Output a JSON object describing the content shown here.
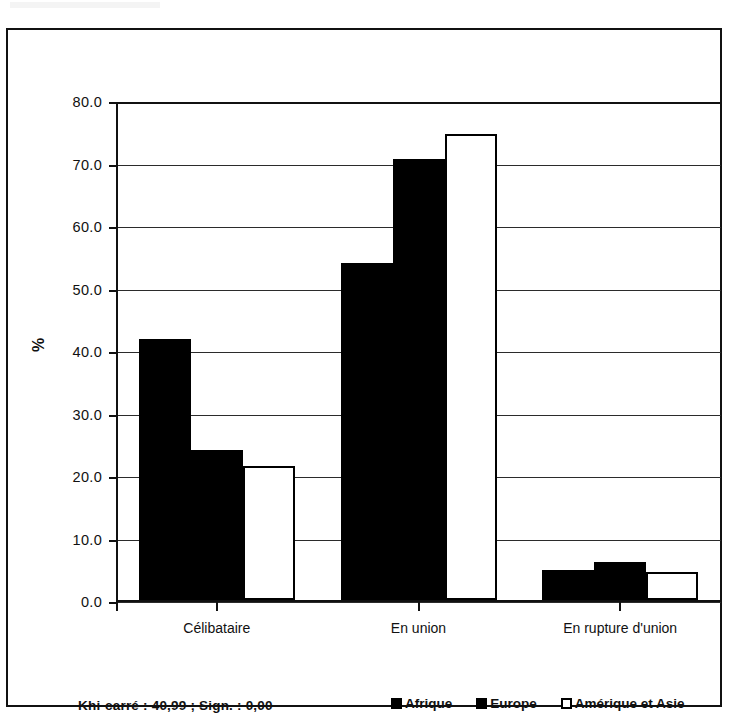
{
  "chart_data": {
    "type": "bar",
    "title": "",
    "xlabel": "",
    "ylabel": "%",
    "ylim": [
      0,
      80
    ],
    "ytick_labels": [
      "80.0",
      "70.0",
      "60.0",
      "50.0",
      "40.0",
      "30.0",
      "20.0",
      "10.0",
      "0.0"
    ],
    "ytick_values": [
      80,
      70,
      60,
      50,
      40,
      30,
      20,
      10,
      0
    ],
    "grid": "horizontal",
    "legend_position": "bottom-right",
    "categories": [
      "Célibataire",
      "En union",
      "En rupture d'union"
    ],
    "series": [
      {
        "name": "Afrique",
        "fill": "solid",
        "color": "#000000",
        "values": [
          41.8,
          53.9,
          4.8
        ]
      },
      {
        "name": "Europe",
        "fill": "solid",
        "color": "#000000",
        "values": [
          24.0,
          70.6,
          6.1
        ]
      },
      {
        "name": "Amérique et Asie",
        "fill": "hollow",
        "color": "#ffffff",
        "values": [
          21.4,
          74.6,
          4.5
        ]
      }
    ],
    "annotations": [
      {
        "name": "statistics-note",
        "text": "Khi-carré : 40,99 ; Sign. : 0,00"
      }
    ]
  },
  "legend": {
    "items": [
      {
        "label": "Afrique",
        "fill": "solid"
      },
      {
        "label": "Europe",
        "fill": "solid"
      },
      {
        "label": "Amérique et Asie",
        "fill": "hollow"
      }
    ]
  },
  "footer": {
    "stat_note": "Khi-carré : 40,99 ; Sign. : 0,00"
  }
}
